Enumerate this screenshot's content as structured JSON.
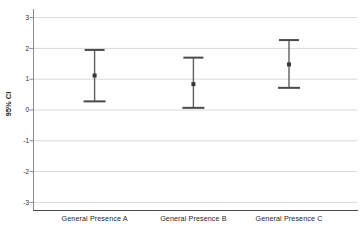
{
  "figure": {
    "background": "#ffffff"
  },
  "chart_data": {
    "type": "scatter",
    "subtype": "error-bar-95-ci",
    "title": "",
    "xlabel": "",
    "ylabel": "95% CI",
    "categories": [
      "General Presence A",
      "General Presence B",
      "General Presence C"
    ],
    "series": [
      {
        "name": "95% CI",
        "points": [
          {
            "category": "General Presence A",
            "mean": 1.12,
            "ci_lower": 0.28,
            "ci_upper": 1.95
          },
          {
            "category": "General Presence B",
            "mean": 0.84,
            "ci_lower": 0.07,
            "ci_upper": 1.7
          },
          {
            "category": "General Presence C",
            "mean": 1.48,
            "ci_lower": 0.72,
            "ci_upper": 2.27
          }
        ]
      }
    ],
    "yticks": [
      3,
      2,
      1,
      0,
      -1,
      -2,
      -3
    ],
    "ylim": [
      -3.3,
      3.3
    ],
    "grid": true,
    "legend": "none",
    "colors": {
      "gridline": "#d9d9d9",
      "axis_left": "#8a8a8a",
      "axis_bottom": "#4d4d4d",
      "error_bar": "#5f5f5f",
      "error_cap": "#4a4a4a",
      "marker": "#383838",
      "text": "#262626"
    }
  }
}
